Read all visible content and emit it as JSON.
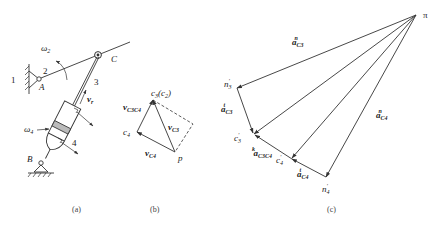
{
  "figure": {
    "panels": [
      {
        "id": "a",
        "caption": "(a)"
      },
      {
        "id": "b",
        "caption": "(b)"
      },
      {
        "id": "c",
        "caption": "(c)"
      }
    ]
  },
  "mechanism": {
    "frame_label": "1",
    "crank_label": "2",
    "slider_label": "3",
    "cylinder_label": "4",
    "pivot_A": "A",
    "pivot_B": "B",
    "joint_C": "C",
    "omega2": "ω",
    "omega2_sub": "2",
    "omega4": "ω",
    "omega4_sub": "4",
    "vr": "v",
    "vr_sub": "r"
  },
  "velocity_polygon": {
    "pole": "p",
    "c3": "c",
    "c3_sub": "3",
    "c3_paren": "(c",
    "c3_paren_sub": "2",
    "c3_paren_close": ")",
    "c4": "c",
    "c4_sub": "4",
    "v_c3c4": "v",
    "v_c3c4_sub": "C3C4",
    "v_c3": "v",
    "v_c3_sub": "C3",
    "v_c4": "v",
    "v_c4_sub": "C4"
  },
  "acceleration_polygon": {
    "pole": "π",
    "n3": "n",
    "n3_sub": "3",
    "n3_sup": "′",
    "c3": "c",
    "c3_sub": "3",
    "c3_sup": "′",
    "c4": "c",
    "c4_sub": "4",
    "c4_sup": "′",
    "n4": "n",
    "n4_sub": "4",
    "n4_sup": "′",
    "a_c3_n": "a",
    "a_c3_n_sub": "C3",
    "a_c3_n_sup": "n",
    "a_c3_t": "a",
    "a_c3_t_sub": "C3",
    "a_c3_t_sup": "t",
    "a_c3c4_k": "a",
    "a_c3c4_k_sub": "C3C4",
    "a_c3c4_k_sup": "k",
    "a_c4_t": "a",
    "a_c4_t_sub": "C4",
    "a_c4_t_sup": "t",
    "a_c4_n": "a",
    "a_c4_n_sub": "C4",
    "a_c4_n_sup": "n"
  }
}
